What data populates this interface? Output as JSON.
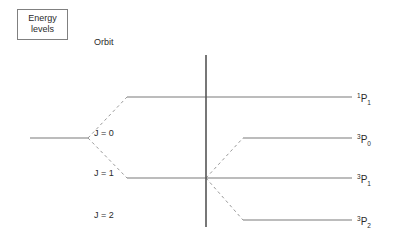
{
  "title_box": {
    "name": "energy-levels-box",
    "line1": "Energy",
    "line2": "levels"
  },
  "columns": [
    {
      "name": "spin-column-header",
      "label": "Spin",
      "x": 163,
      "y": 38
    },
    {
      "name": "orbit-column-header",
      "label": "Orbit",
      "x": 291,
      "y": 38
    }
  ],
  "base_level": {
    "name": "base-level-1s2p",
    "label": "1s2p",
    "label_x": 60,
    "label_y": 130,
    "x1": 30,
    "x2": 88,
    "y": 138
  },
  "spin_levels": [
    {
      "name": "spin-level-singlet",
      "label": "S = 0",
      "label_x": 163,
      "label_y": 88,
      "x1": 127,
      "x2": 206,
      "y": 97
    },
    {
      "name": "spin-level-triplet",
      "label": "S = 1",
      "label_x": 163,
      "label_y": 169,
      "x1": 127,
      "x2": 206,
      "y": 178
    }
  ],
  "orbit_levels": [
    {
      "name": "orbit-level-j0",
      "label": "J = 0",
      "label_x": 291,
      "label_y": 129,
      "x1": 243,
      "x2": 352,
      "y": 138,
      "term_sup": "3",
      "term_symbol": "P",
      "term_sub": "0",
      "term_x": 357,
      "term_y": 133
    },
    {
      "name": "orbit-level-j1",
      "label": "J = 1",
      "label_x": 291,
      "label_y": 169,
      "x1": 206,
      "x2": 352,
      "y": 178,
      "term_sup": "3",
      "term_symbol": "P",
      "term_sub": "1",
      "term_x": 357,
      "term_y": 173
    },
    {
      "name": "orbit-level-j2",
      "label": "J = 2",
      "label_x": 291,
      "label_y": 211,
      "x1": 243,
      "x2": 352,
      "y": 220,
      "term_sup": "3",
      "term_symbol": "P",
      "term_sub": "2",
      "term_x": 357,
      "term_y": 215
    }
  ],
  "singlet_term": {
    "name": "term-symbol-singlet-p1",
    "term_sup": "1",
    "term_symbol": "P",
    "term_sub": "1",
    "term_x": 357,
    "term_y": 92
  },
  "singlet_level_line": {
    "name": "orbit-level-singlet",
    "x1": 206,
    "x2": 352,
    "y": 97
  },
  "divider": {
    "name": "spin-orbit-divider",
    "x": 206,
    "y1": 55,
    "y2": 227
  },
  "connectors": [
    {
      "name": "connector-base-to-singlet",
      "x1": 88,
      "y1": 138,
      "x2": 127,
      "y2": 97
    },
    {
      "name": "connector-base-to-triplet",
      "x1": 88,
      "y1": 138,
      "x2": 127,
      "y2": 178
    },
    {
      "name": "connector-triplet-to-j0",
      "x1": 206,
      "y1": 178,
      "x2": 243,
      "y2": 138
    },
    {
      "name": "connector-triplet-to-j2",
      "x1": 206,
      "y1": 178,
      "x2": 243,
      "y2": 220
    }
  ],
  "style": {
    "line_color": "#7a7a7a",
    "divider_color": "#555555",
    "dash_color": "#9a9a9a",
    "text_color": "#2b2b2b",
    "box_border": "#808080",
    "background": "#ffffff"
  }
}
